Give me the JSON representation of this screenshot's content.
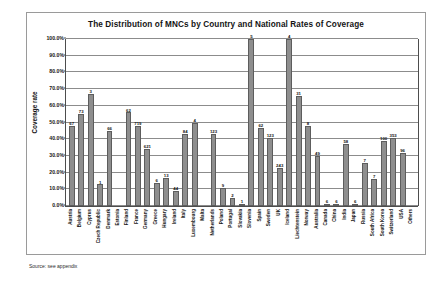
{
  "chart": {
    "title": "The Distribution of MNCs by Country and National Rates of Coverage",
    "ylabel": "Coverage rate",
    "source_note": "Source: see appendix"
  },
  "chart_data": {
    "type": "bar",
    "title": "The Distribution of MNCs by Country and National Rates of Coverage",
    "xlabel": "",
    "ylabel": "Coverage rate",
    "ylim": [
      0,
      100
    ],
    "grid": true,
    "legend": "none",
    "ytick_labels": [
      "100.0%",
      "90.0%",
      "80.0%",
      "70.0%",
      "60.0%",
      "50.0%",
      "40.0%",
      "30.0%",
      "20.0%",
      "10.0%",
      "0.0%"
    ],
    "ytick_values": [
      100,
      90,
      80,
      70,
      60,
      50,
      40,
      30,
      20,
      10,
      0
    ],
    "categories": [
      "Austria",
      "Belgium",
      "Cyprus",
      "Czech Republic",
      "Denmark",
      "Estonia",
      "Finland",
      "France",
      "Germany",
      "Greece",
      "Hungary",
      "Ireland",
      "Italy",
      "Luxembourg",
      "Malta",
      "Netherlands",
      "Poland",
      "Portugal",
      "Slovakia",
      "Slovenia",
      "Spain",
      "Sweden",
      "UK",
      "Iceland",
      "Liechtenstein",
      "Norway",
      "Australia",
      "Canada",
      "China",
      "India",
      "Japan",
      "Russia",
      "South Africa",
      "South Korea",
      "Switzerland",
      "USA",
      "Others"
    ],
    "values": [
      48,
      55,
      67,
      13,
      45,
      0,
      56,
      48,
      34,
      14,
      17,
      9,
      43,
      50,
      0,
      43,
      11,
      5,
      1,
      100,
      47,
      41,
      23,
      100,
      66,
      48,
      30,
      1,
      1,
      37,
      1,
      26,
      16,
      39,
      41,
      32,
      0
    ],
    "data_labels": [
      "67",
      "73",
      "3",
      "1",
      "66",
      "",
      "62",
      "719",
      "621",
      "6",
      "13",
      "44",
      "84",
      "4",
      "1",
      "123",
      "9",
      "2",
      "1",
      "5",
      "62",
      "123",
      "243",
      "4",
      "31",
      "8",
      "49",
      "6",
      "6",
      "58",
      "6",
      "7",
      "7",
      "100",
      "353",
      "96",
      ""
    ]
  }
}
